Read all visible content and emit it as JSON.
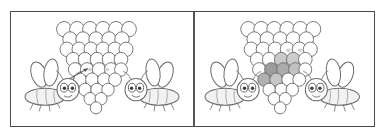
{
  "figure": {
    "type": "spot-the-difference",
    "background_color": "#ffffff",
    "frame_color": "#4a4a4a",
    "line_color": "#5a5a5a",
    "shade_colors": [
      "#b9b9b9",
      "#a8a8a8",
      "#cfcfcf",
      "#9e9e9e"
    ],
    "panel_count": 2
  },
  "panels": [
    {
      "id": "left",
      "label": "",
      "hive": {
        "label": "",
        "shaded_cells": 0,
        "marked_cells": 2,
        "rows": 8,
        "shape": "inverted-triangle"
      },
      "pointer": {
        "visible": true,
        "label": ""
      },
      "bees": [
        {
          "id": "left-bee",
          "facing": "right",
          "label": ""
        },
        {
          "id": "right-bee",
          "facing": "left",
          "label": ""
        }
      ]
    },
    {
      "id": "right",
      "label": "",
      "hive": {
        "label": "",
        "shaded_cells": 7,
        "marked_cells": 2,
        "rows": 8,
        "shape": "inverted-triangle"
      },
      "pointer": {
        "visible": false,
        "label": ""
      },
      "bees": [
        {
          "id": "left-bee",
          "facing": "right",
          "label": ""
        },
        {
          "id": "right-bee",
          "facing": "left",
          "label": ""
        }
      ]
    }
  ]
}
